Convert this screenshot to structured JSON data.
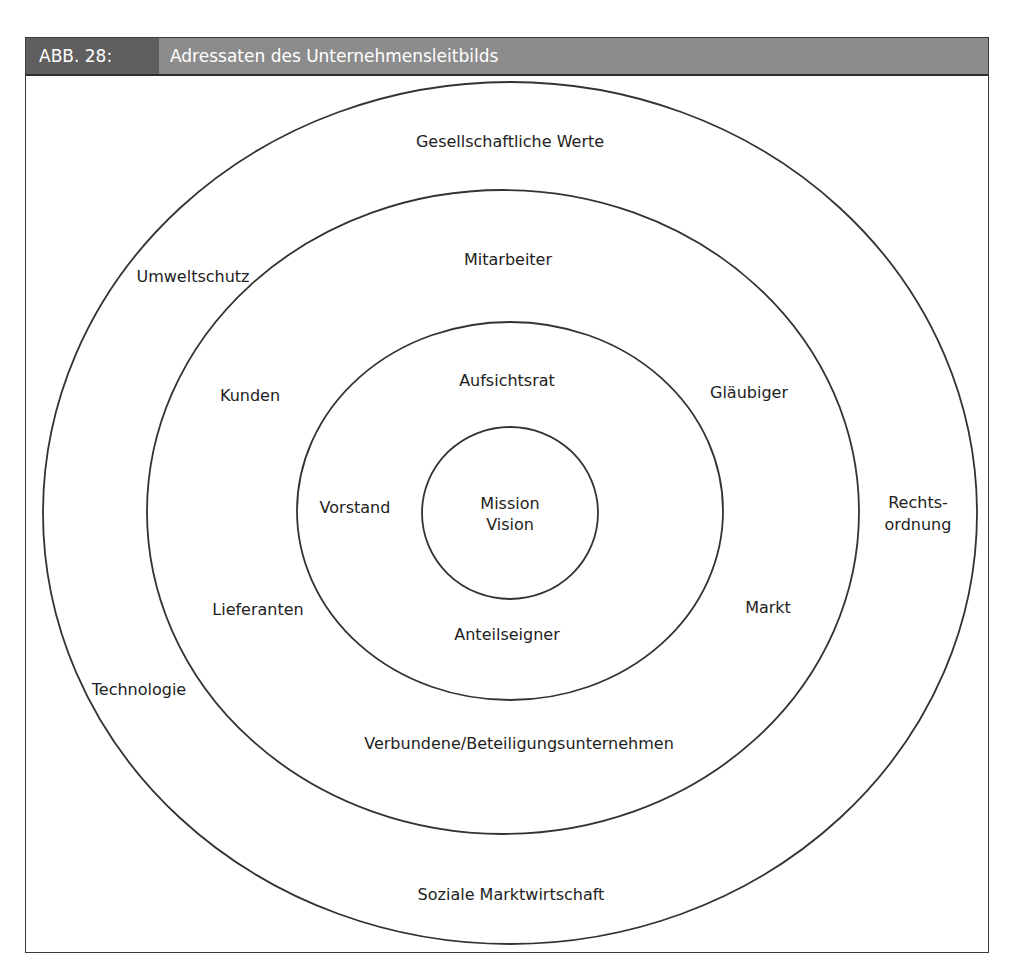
{
  "figure": {
    "number": "ABB. 28:",
    "title": "Adressaten des Unternehmensleitbilds"
  },
  "rings": [
    {
      "name": "outer",
      "labels": {
        "top": "Gesellschaftliche Werte",
        "upper_left": "Umweltschutz",
        "right_line1": "Rechts-",
        "right_line2": "ordnung",
        "lower_left": "Technologie",
        "bottom": "Soziale Marktwirtschaft"
      }
    },
    {
      "name": "second",
      "labels": {
        "top": "Mitarbeiter",
        "upper_left": "Kunden",
        "upper_right": "Gläubiger",
        "lower_left": "Lieferanten",
        "lower_right": "Markt",
        "bottom": "Verbundene/Beteiligungsunternehmen"
      }
    },
    {
      "name": "third",
      "labels": {
        "top": "Aufsichtsrat",
        "left": "Vorstand",
        "bottom": "Anteilseigner"
      }
    },
    {
      "name": "core",
      "labels": {
        "line1": "Mission",
        "line2": "Vision"
      }
    }
  ],
  "colors": {
    "header_dark": "#5f5f5f",
    "header_light": "#8c8c8c",
    "line": "#333333",
    "text": "#222222"
  }
}
